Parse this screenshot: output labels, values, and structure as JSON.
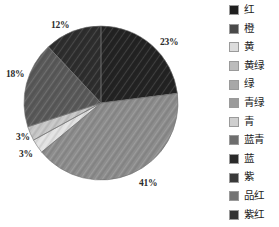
{
  "chart_data": {
    "type": "pie",
    "title": "",
    "subtitle": "",
    "xlabel": "",
    "ylabel": "",
    "grid": false,
    "legend_position": "right",
    "start_angle_deg": 0,
    "direction": "clockwise",
    "center": {
      "x": 101,
      "y": 103,
      "radius": 77
    },
    "categories": [
      "红",
      "橙",
      "黄",
      "黄绿",
      "绿",
      "青绿"
    ],
    "values": [
      23,
      41,
      3,
      3,
      18,
      12
    ],
    "value_unit": "%",
    "data_labels": [
      "23%",
      "41%",
      "3%",
      "3%",
      "18%",
      "12%"
    ],
    "slices": [
      {
        "name": "红",
        "value": 23,
        "label": "23%",
        "color": "#232323",
        "texture": "diagonal-hatch",
        "start_deg": 0,
        "end_deg": 82.8
      },
      {
        "name": "橙",
        "value": 41,
        "label": "41%",
        "color": "#8d8d8d",
        "texture": "diagonal-hatch",
        "start_deg": 82.8,
        "end_deg": 230.4
      },
      {
        "name": "黄",
        "value": 3,
        "label": "3%",
        "color": "#e2e2e2",
        "texture": "diagonal-hatch",
        "start_deg": 230.4,
        "end_deg": 241.2
      },
      {
        "name": "黄绿",
        "value": 3,
        "label": "3%",
        "color": "#c6c6c6",
        "texture": "diagonal-hatch",
        "start_deg": 241.2,
        "end_deg": 252.0
      },
      {
        "name": "绿",
        "value": 18,
        "label": "18%",
        "color": "#5a5a5a",
        "texture": "diagonal-hatch",
        "start_deg": 252.0,
        "end_deg": 316.8
      },
      {
        "name": "青绿",
        "value": 12,
        "label": "12%",
        "color": "#2e2e2e",
        "texture": "diagonal-hatch",
        "start_deg": 316.8,
        "end_deg": 360.0
      }
    ]
  },
  "labels": {
    "l23": "23%",
    "l41": "41%",
    "l3a": "3%",
    "l3b": "3%",
    "l18": "18%",
    "l12": "12%"
  },
  "legend": {
    "items": [
      {
        "label": "红",
        "color": "#1f1f1f"
      },
      {
        "label": "橙",
        "color": "#4a4a4a"
      },
      {
        "label": "黄",
        "color": "#dcdcdc"
      },
      {
        "label": "黄绿",
        "color": "#bcbcbc"
      },
      {
        "label": "绿",
        "color": "#a8a8a8"
      },
      {
        "label": "青绿",
        "color": "#9b9b9b"
      },
      {
        "label": "青",
        "color": "#cfcfcf"
      },
      {
        "label": "蓝青",
        "color": "#6e6e6e"
      },
      {
        "label": "蓝",
        "color": "#2a2a2a"
      },
      {
        "label": "紫",
        "color": "#3a3a3a"
      },
      {
        "label": "品红",
        "color": "#747474"
      },
      {
        "label": "紫红",
        "color": "#333333"
      }
    ]
  }
}
